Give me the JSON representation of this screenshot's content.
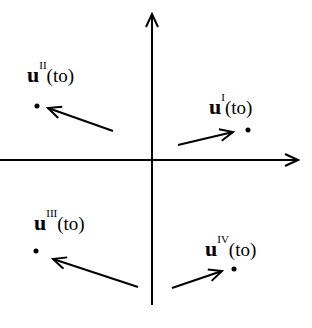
{
  "diagram": {
    "axes": {
      "x_axis": {
        "from": [
          0,
          160
        ],
        "to": [
          300,
          160
        ],
        "arrowhead": "right"
      },
      "y_axis": {
        "from": [
          152,
          305
        ],
        "to": [
          152,
          12
        ],
        "arrowhead": "up"
      }
    },
    "colors": {
      "stroke": "#000000",
      "background": "#ffffff"
    },
    "quadrants": [
      {
        "id": "I",
        "label": {
          "symbol": "u",
          "superscript": "I",
          "argument": "(to)"
        },
        "label_pos": [
          209,
          96
        ],
        "point": [
          248,
          130
        ],
        "arrow": {
          "from": [
            178,
            145
          ],
          "to": [
            233,
            132
          ]
        }
      },
      {
        "id": "II",
        "label": {
          "symbol": "u",
          "superscript": "II",
          "argument": "(to)"
        },
        "label_pos": [
          27,
          64
        ],
        "point": [
          37,
          106
        ],
        "arrow": {
          "from": [
            113,
            131
          ],
          "to": [
            48,
            108
          ]
        }
      },
      {
        "id": "III",
        "label": {
          "symbol": "u",
          "superscript": "III",
          "argument": "(to)"
        },
        "label_pos": [
          34,
          212
        ],
        "point": [
          36,
          251
        ],
        "arrow": {
          "from": [
            138,
            287
          ],
          "to": [
            53,
            259
          ]
        }
      },
      {
        "id": "IV",
        "label": {
          "symbol": "u",
          "superscript": "IV",
          "argument": "(to)"
        },
        "label_pos": [
          205,
          238
        ],
        "point": [
          234,
          269
        ],
        "arrow": {
          "from": [
            172,
            288
          ],
          "to": [
            222,
            271
          ]
        }
      }
    ]
  }
}
